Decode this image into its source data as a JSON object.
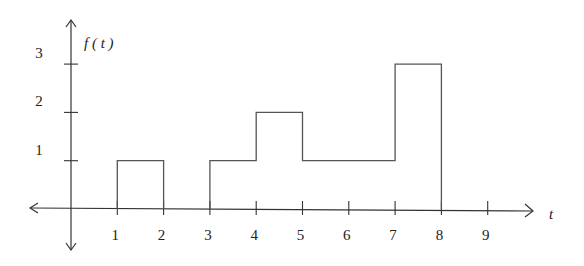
{
  "chart_data": {
    "type": "line",
    "subtype": "step",
    "title": "",
    "xlabel": "t",
    "ylabel": "f(t)",
    "x_ticks": [
      "1",
      "2",
      "3",
      "4",
      "5",
      "6",
      "7",
      "8",
      "9"
    ],
    "y_ticks": [
      "1",
      "2",
      "3"
    ],
    "xlim": [
      -1,
      10
    ],
    "ylim": [
      -1,
      3.5
    ],
    "grid": false,
    "legend": null,
    "segments": [
      {
        "x_start": 1,
        "x_end": 2,
        "value": 1
      },
      {
        "x_start": 3,
        "x_end": 4,
        "value": 1
      },
      {
        "x_start": 4,
        "x_end": 5,
        "value": 2
      },
      {
        "x_start": 5,
        "x_end": 7,
        "value": 1
      },
      {
        "x_start": 7,
        "x_end": 8,
        "value": 3
      }
    ],
    "default_value": 0
  }
}
